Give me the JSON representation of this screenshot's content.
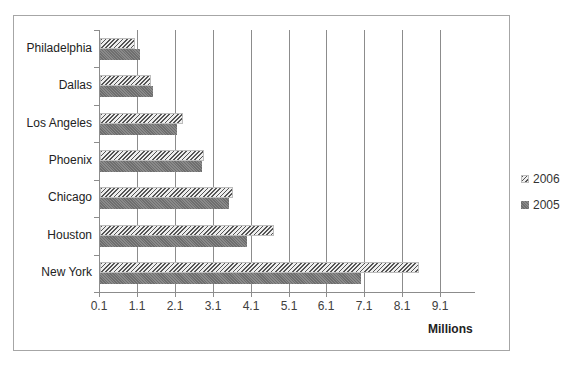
{
  "chart_data": {
    "type": "bar",
    "orientation": "horizontal",
    "title": "",
    "xlabel": "Millions",
    "ylabel": "",
    "categories": [
      "New York",
      "Houston",
      "Chicago",
      "Phoenix",
      "Los Angeles",
      "Dallas",
      "Philadelphia"
    ],
    "series": [
      {
        "name": "2006",
        "values": [
          8.52,
          4.69,
          3.61,
          2.84,
          2.29,
          1.45,
          1.02
        ]
      },
      {
        "name": "2005",
        "values": [
          6.99,
          3.98,
          3.5,
          2.79,
          2.13,
          1.5,
          1.16
        ]
      }
    ],
    "xticks": [
      "0.1",
      "1.1",
      "2.1",
      "3.1",
      "4.1",
      "5.1",
      "6.1",
      "7.1",
      "8.1",
      "9.1"
    ],
    "xlim": [
      0.1,
      10.0
    ],
    "grid": "vertical",
    "legend_position": "right"
  },
  "legend": [
    {
      "label": "2006",
      "style": "hatched"
    },
    {
      "label": "2005",
      "style": "solid-gray"
    }
  ]
}
